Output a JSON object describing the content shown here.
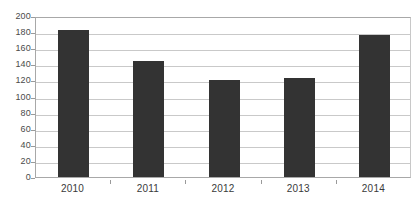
{
  "chart_data": {
    "type": "bar",
    "title": "",
    "subtitle": "",
    "xlabel": "",
    "ylabel": "",
    "categories": [
      "2010",
      "2011",
      "2012",
      "2013",
      "2014"
    ],
    "values": [
      183,
      144,
      120,
      123,
      176
    ],
    "series": [
      {
        "name": "",
        "values": [
          183,
          144,
          120,
          123,
          176
        ]
      }
    ],
    "ylim": [
      0,
      200
    ],
    "yticks": [
      0,
      20,
      40,
      60,
      80,
      100,
      120,
      140,
      160,
      180,
      200
    ],
    "ytick_labels": [
      "0",
      "20",
      "40",
      "60",
      "80",
      "100",
      "120",
      "140",
      "160",
      "180",
      "200"
    ],
    "grid": true,
    "grid_axis": "y",
    "legend": false,
    "legend_position": "none",
    "bar_color": "#333333",
    "gridline_color": "#c9c9c9",
    "axis_color": "#a8a8a8",
    "background_color": "#ffffff",
    "annotations": []
  }
}
